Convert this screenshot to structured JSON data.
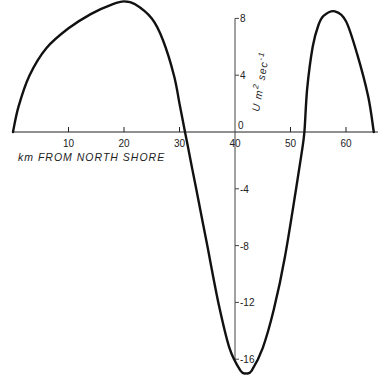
{
  "chart_data": {
    "type": "line",
    "title": "",
    "xlabel": "km FROM NORTH SHORE",
    "ylabel": "U m² sec⁻¹",
    "xlim": [
      0,
      66
    ],
    "ylim": [
      -17.5,
      9.5
    ],
    "grid": false,
    "legend": null,
    "x_ticks": [
      10,
      20,
      30,
      40,
      50,
      60
    ],
    "y_ticks": [
      8,
      4,
      0,
      -4,
      -8,
      -12,
      -16
    ],
    "y_axis_at_x": 40,
    "series": [
      {
        "name": "U",
        "x": [
          0,
          1,
          3,
          6,
          10,
          14,
          18,
          20,
          22,
          25,
          27,
          29,
          30,
          31,
          32,
          33,
          35,
          37,
          39,
          41,
          42,
          43,
          45,
          47,
          49,
          51,
          52,
          52.5,
          53,
          54,
          55,
          56,
          58,
          60,
          62,
          64,
          65
        ],
        "values": [
          0,
          1.8,
          4.0,
          5.9,
          7.3,
          8.3,
          9.0,
          9.2,
          9.0,
          8.0,
          6.5,
          4.0,
          2.0,
          0,
          -2.0,
          -4.0,
          -8.0,
          -12.0,
          -15.2,
          -16.8,
          -17.0,
          -16.8,
          -15.2,
          -12.5,
          -8.8,
          -4.0,
          -1.5,
          0,
          3.0,
          6.0,
          7.5,
          8.2,
          8.5,
          7.8,
          5.5,
          2.5,
          0
        ]
      }
    ]
  },
  "axes": {
    "x_tick_labels": [
      "10",
      "20",
      "30",
      "40",
      "50",
      "60"
    ],
    "y_tick_labels": [
      "8",
      "4",
      "0",
      "-4",
      "-8",
      "-12",
      "-16"
    ],
    "xlabel": "km FROM NORTH SHORE",
    "ylabel_main": "U  m",
    "ylabel_sup1": "2",
    "ylabel_sec": " sec",
    "ylabel_sup2": "-1"
  }
}
